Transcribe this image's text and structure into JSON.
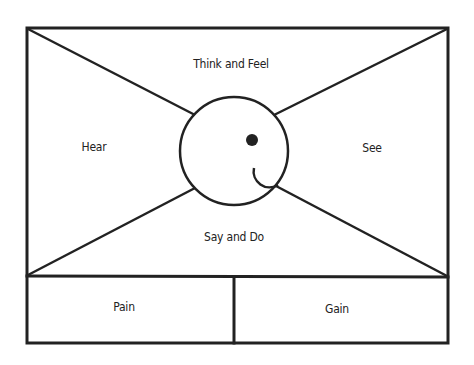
{
  "diagram": {
    "type": "empathy-map",
    "quadrants": {
      "top": "Think and Feel",
      "left": "Hear",
      "right": "See",
      "bottom": "Say and Do"
    },
    "bottom_boxes": {
      "left": "Pain",
      "right": "Gain"
    },
    "center_icon": "smiley-face-icon",
    "colors": {
      "stroke": "#222222",
      "background": "#ffffff"
    }
  }
}
